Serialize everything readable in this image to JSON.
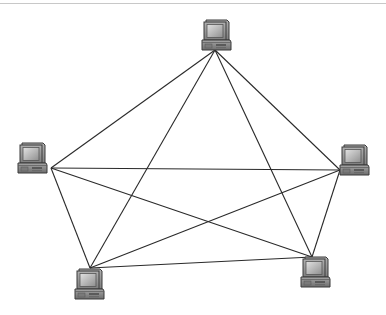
{
  "diagram": {
    "type": "full-mesh-network",
    "canvas": {
      "width": 386,
      "height": 315,
      "background": "#ffffff"
    },
    "top_rule": {
      "y": 3,
      "color": "#c8c8c8"
    },
    "edge_color": "#2a2a2a",
    "edge_width": 1.1,
    "nodes": [
      {
        "id": "pc-top",
        "icon": "desktop-computer-icon",
        "x": 203,
        "y": 19,
        "anchor": [
          215,
          50
        ]
      },
      {
        "id": "pc-left",
        "icon": "desktop-computer-icon",
        "x": 19,
        "y": 142,
        "anchor": [
          51,
          168
        ]
      },
      {
        "id": "pc-right",
        "icon": "desktop-computer-icon",
        "x": 341,
        "y": 144,
        "anchor": [
          340,
          170
        ]
      },
      {
        "id": "pc-bottom-left",
        "icon": "desktop-computer-icon",
        "x": 76,
        "y": 268,
        "anchor": [
          90,
          268
        ]
      },
      {
        "id": "pc-bottom-right",
        "icon": "desktop-computer-icon",
        "x": 302,
        "y": 256,
        "anchor": [
          312,
          257
        ]
      }
    ],
    "edges": [
      [
        "pc-top",
        "pc-left"
      ],
      [
        "pc-top",
        "pc-right"
      ],
      [
        "pc-top",
        "pc-bottom-left"
      ],
      [
        "pc-top",
        "pc-bottom-right"
      ],
      [
        "pc-left",
        "pc-right"
      ],
      [
        "pc-left",
        "pc-bottom-left"
      ],
      [
        "pc-left",
        "pc-bottom-right"
      ],
      [
        "pc-right",
        "pc-bottom-left"
      ],
      [
        "pc-right",
        "pc-bottom-right"
      ],
      [
        "pc-bottom-left",
        "pc-bottom-right"
      ]
    ],
    "icon_colors": {
      "outline": "#3a3a3a",
      "monitor_body": "#9a9a9a",
      "screen_dark": "#8c8c8c",
      "screen_light": "#d8d8d8",
      "base_body": "#8a8a8a",
      "base_slot": "#5a5a5a"
    }
  }
}
